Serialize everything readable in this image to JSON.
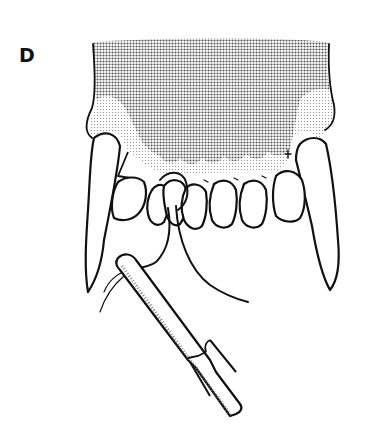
{
  "figure": {
    "panel_label": "D",
    "elements": [
      "maxilla",
      "gingiva",
      "left-canine",
      "right-canine",
      "incisors",
      "wire",
      "needle-holder"
    ],
    "colors": {
      "ink": "#111111",
      "bone_shade": "#9a9a9a",
      "gingiva_shade": "#d8d8d8",
      "background": "#ffffff"
    }
  }
}
